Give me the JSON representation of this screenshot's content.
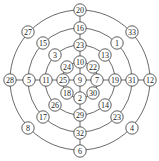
{
  "diagram": {
    "type": "concentric-ring-graph",
    "center": {
      "x": 80,
      "y": 80
    },
    "rings": [
      {
        "name": "ring-1",
        "radius": 18
      },
      {
        "name": "ring-2",
        "radius": 35
      },
      {
        "name": "ring-3",
        "radius": 52
      },
      {
        "name": "ring-4",
        "radius": 70
      }
    ],
    "nodes": [
      {
        "id": "n9",
        "label": "9",
        "x": 80,
        "y": 80
      },
      {
        "id": "n10",
        "label": "10",
        "x": 80,
        "y": 62
      },
      {
        "id": "n23a",
        "label": "23",
        "x": 80,
        "y": 45
      },
      {
        "id": "n16",
        "label": "16",
        "x": 80,
        "y": 28
      },
      {
        "id": "n20",
        "label": "20",
        "x": 80,
        "y": 10
      },
      {
        "id": "n2",
        "label": "2",
        "x": 80,
        "y": 98
      },
      {
        "id": "n29",
        "label": "29",
        "x": 80,
        "y": 115
      },
      {
        "id": "n32",
        "label": "32",
        "x": 80,
        "y": 133
      },
      {
        "id": "n6",
        "label": "6",
        "x": 80,
        "y": 151
      },
      {
        "id": "n25",
        "label": "25",
        "x": 63,
        "y": 80
      },
      {
        "id": "n11",
        "label": "11",
        "x": 46,
        "y": 80
      },
      {
        "id": "n5",
        "label": "5",
        "x": 29,
        "y": 80
      },
      {
        "id": "n28",
        "label": "28",
        "x": 10,
        "y": 80
      },
      {
        "id": "n7",
        "label": "7",
        "x": 97,
        "y": 80
      },
      {
        "id": "n19",
        "label": "19",
        "x": 115,
        "y": 80
      },
      {
        "id": "n31",
        "label": "31",
        "x": 132,
        "y": 80
      },
      {
        "id": "n12",
        "label": "12",
        "x": 150,
        "y": 80
      },
      {
        "id": "n24",
        "label": "24",
        "x": 67,
        "y": 67
      },
      {
        "id": "n22",
        "label": "22",
        "x": 93,
        "y": 67
      },
      {
        "id": "n18",
        "label": "18",
        "x": 67,
        "y": 93
      },
      {
        "id": "n30",
        "label": "30",
        "x": 93,
        "y": 93
      },
      {
        "id": "n3",
        "label": "3",
        "x": 55,
        "y": 55
      },
      {
        "id": "n13",
        "label": "13",
        "x": 105,
        "y": 55
      },
      {
        "id": "n26",
        "label": "26",
        "x": 55,
        "y": 105
      },
      {
        "id": "n14",
        "label": "14",
        "x": 105,
        "y": 105
      },
      {
        "id": "n15",
        "label": "15",
        "x": 43,
        "y": 43
      },
      {
        "id": "n1",
        "label": "1",
        "x": 117,
        "y": 43
      },
      {
        "id": "n17",
        "label": "17",
        "x": 43,
        "y": 117
      },
      {
        "id": "n23b",
        "label": "23",
        "x": 117,
        "y": 117
      },
      {
        "id": "n27",
        "label": "27",
        "x": 28,
        "y": 32
      },
      {
        "id": "n33",
        "label": "33",
        "x": 132,
        "y": 32
      },
      {
        "id": "n8",
        "label": "8",
        "x": 28,
        "y": 128
      },
      {
        "id": "n4",
        "label": "4",
        "x": 132,
        "y": 128
      }
    ],
    "spines": [
      {
        "from": "n20",
        "to": "n6"
      },
      {
        "from": "n28",
        "to": "n12"
      }
    ]
  }
}
